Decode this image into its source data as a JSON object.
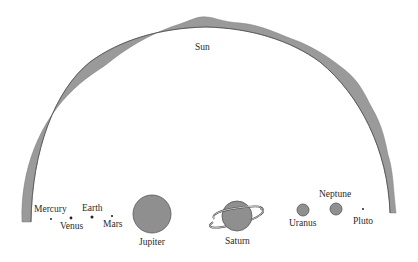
{
  "diagram": {
    "colors": {
      "sun_arc": "#9a9a9a",
      "sun_arc_edge": "#5a5a5a",
      "planet_fill": "#8f8f8f",
      "planet_stroke": "#555555",
      "text": "#2a2a2a",
      "background": "#ffffff"
    },
    "sun": {
      "label": "Sun"
    },
    "planets": [
      {
        "name": "Mercury",
        "label": "Mercury"
      },
      {
        "name": "Venus",
        "label": "Venus"
      },
      {
        "name": "Earth",
        "label": "Earth"
      },
      {
        "name": "Mars",
        "label": "Mars"
      },
      {
        "name": "Jupiter",
        "label": "Jupiter"
      },
      {
        "name": "Saturn",
        "label": "Saturn"
      },
      {
        "name": "Uranus",
        "label": "Uranus"
      },
      {
        "name": "Neptune",
        "label": "Neptune"
      },
      {
        "name": "Pluto",
        "label": "Pluto"
      }
    ]
  }
}
